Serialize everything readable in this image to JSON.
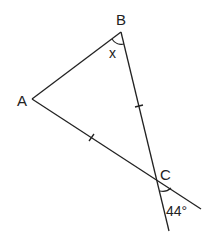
{
  "diagram": {
    "type": "geometry-triangle",
    "vertices": {
      "A": {
        "label": "A",
        "x": 32,
        "y": 99
      },
      "B": {
        "label": "B",
        "x": 121,
        "y": 32
      },
      "C": {
        "label": "C",
        "x": 157,
        "y": 179
      }
    },
    "extensions": {
      "AC_beyond_C": {
        "x": 201,
        "y": 209
      },
      "BC_beyond_C": {
        "x": 169,
        "y": 231
      }
    },
    "angle_labels": {
      "at_B": "x",
      "at_C_vertical": "44°"
    },
    "tick_marks": [
      "BC",
      "AC"
    ],
    "line_color": "#222222"
  }
}
